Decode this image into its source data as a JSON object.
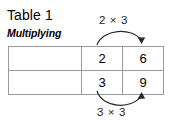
{
  "figure": {
    "title": "Table 1",
    "subtitle": "Multiplying"
  },
  "table": {
    "rows": [
      {
        "header": "Servings",
        "values": [
          "2",
          "6"
        ]
      },
      {
        "header": "Cups",
        "values": [
          "3",
          "9"
        ]
      }
    ]
  },
  "annotations": {
    "top": {
      "label": "2 × 3",
      "icon": "curved-arrow-right-icon",
      "direction": "left-to-right"
    },
    "bottom": {
      "label": "3 × 3",
      "icon": "curved-arrow-right-icon",
      "direction": "left-to-right"
    }
  },
  "colors": {
    "header_background": "#000000",
    "header_text": "#ffffff",
    "grid_line": "#9a9a9a",
    "annotation": "#2b2b2b",
    "page_background": "#ffffff"
  }
}
